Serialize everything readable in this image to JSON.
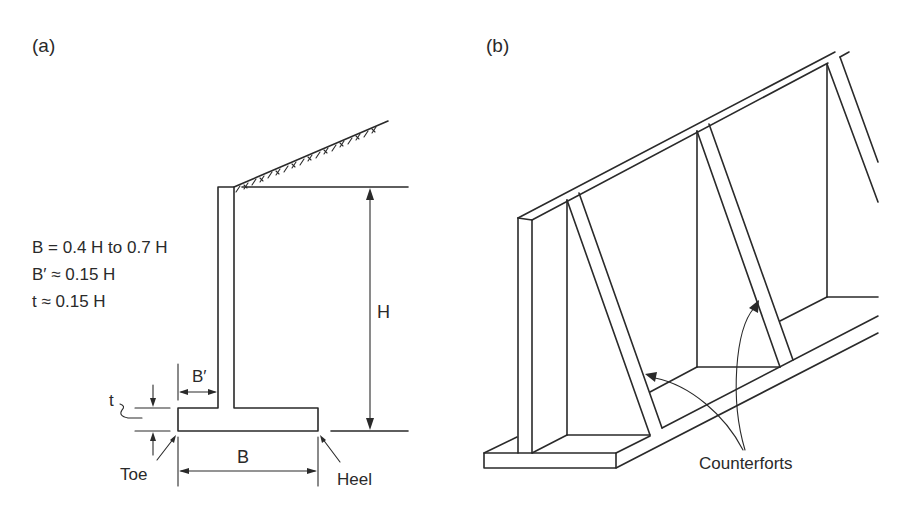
{
  "figure": {
    "panel_a": {
      "label": "(a)",
      "equations": [
        "B = 0.4 H to 0.7 H",
        "B′ ≈ 0.15 H",
        "t ≈ 0.15 H"
      ],
      "dimension_labels": {
        "height": "H",
        "base_width": "B",
        "toe_width": "B′",
        "thickness": "t"
      },
      "part_labels": {
        "toe": "Toe",
        "heel": "Heel"
      }
    },
    "panel_b": {
      "label": "(b)",
      "callout": "Counterforts"
    },
    "colors": {
      "line": "#2a2a2a",
      "background": "#ffffff"
    }
  }
}
